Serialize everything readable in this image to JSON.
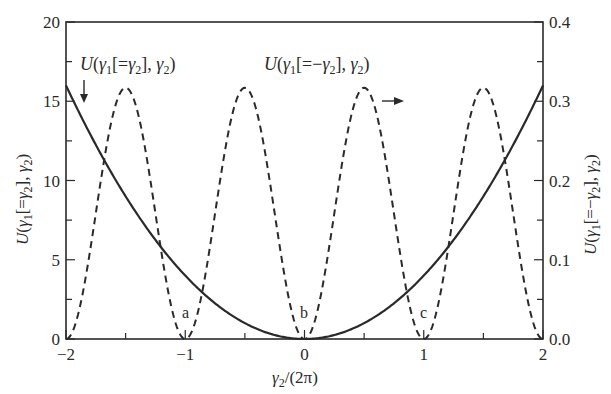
{
  "chart_data": {
    "type": "line",
    "title": "",
    "xlabel": "γ2/(2π)",
    "ylabel_left": "U(γ1[=γ2], γ2)",
    "ylabel_right": "U(γ1[=−γ2], γ2)",
    "xlim": [
      -2,
      2
    ],
    "ylim_left": [
      0,
      20
    ],
    "ylim_right": [
      0.0,
      0.4
    ],
    "grid": false,
    "legend": "none (inline annotations with arrows)",
    "x_ticks_major": [
      -2,
      -1,
      0,
      1,
      2
    ],
    "x_tick_labels": [
      "−2",
      "−1",
      "0",
      "1",
      "2"
    ],
    "x_ticks_minor": [
      -1.5,
      -0.5,
      0.5,
      1.5
    ],
    "y_left_ticks_major": [
      0,
      5,
      10,
      15,
      20
    ],
    "y_left_tick_labels": [
      "0",
      "5",
      "10",
      "15",
      "20"
    ],
    "y_left_ticks_minor": [
      2.5,
      7.5,
      12.5,
      17.5
    ],
    "y_right_ticks_major": [
      0.0,
      0.1,
      0.2,
      0.3,
      0.4
    ],
    "y_right_tick_labels": [
      "0.0",
      "0.1",
      "0.2",
      "0.3",
      "0.4"
    ],
    "y_right_ticks_minor": [
      0.05,
      0.15,
      0.25,
      0.35
    ],
    "series": [
      {
        "name": "U(γ1[=γ2], γ2)",
        "axis": "left",
        "style": "solid",
        "formula": "4*x^2",
        "x": [
          -2,
          -1.75,
          -1.5,
          -1.25,
          -1,
          -0.75,
          -0.5,
          -0.25,
          0,
          0.25,
          0.5,
          0.75,
          1,
          1.25,
          1.5,
          1.75,
          2
        ],
        "values": [
          16,
          12.25,
          9,
          6.25,
          4,
          2.25,
          1,
          0.25,
          0,
          0.25,
          1,
          2.25,
          4,
          6.25,
          9,
          12.25,
          16
        ]
      },
      {
        "name": "U(γ1[=−γ2], γ2)",
        "axis": "right",
        "style": "dashed",
        "formula": "0.317*sin^2(pi*x)",
        "x": [
          -2,
          -1.75,
          -1.5,
          -1.25,
          -1,
          -0.75,
          -0.5,
          -0.25,
          0,
          0.25,
          0.5,
          0.75,
          1,
          1.25,
          1.5,
          1.75,
          2
        ],
        "values": [
          0,
          0.158,
          0.317,
          0.158,
          0,
          0.158,
          0.317,
          0.158,
          0,
          0.158,
          0.317,
          0.158,
          0,
          0.158,
          0.317,
          0.158,
          0
        ]
      }
    ],
    "annotations": [
      {
        "text": "U(γ1[=γ2], γ2)",
        "arrow": "down",
        "points_to": "solid curve"
      },
      {
        "text": "U(γ1[=−γ2], γ2)",
        "arrow": "right",
        "points_to": "right axis"
      },
      {
        "text": "a",
        "x": -1
      },
      {
        "text": "b",
        "x": 0
      },
      {
        "text": "c",
        "x": 1
      }
    ]
  },
  "labels": {
    "xlabel_main": "γ",
    "xlabel_sub": "2",
    "xlabel_tail": "/(2π)",
    "point_a": "a",
    "point_b": "b",
    "point_c": "c"
  }
}
